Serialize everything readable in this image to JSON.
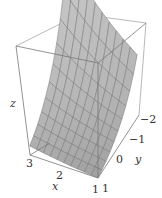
{
  "chart_data": {
    "type": "surface3d",
    "title": "",
    "xlabel": "x",
    "ylabel": "y",
    "zlabel": "z",
    "x_ticks": [
      "1",
      "2",
      "3"
    ],
    "y_ticks": [
      "0",
      "−1",
      "−2"
    ],
    "z_ticks": [],
    "xlim": [
      1,
      3
    ],
    "ylim": [
      -2,
      1
    ],
    "grid_lines": 10,
    "surface_description": "Mesh surface rising steeply toward x=1, y=-2 corner and flattening toward large x / positive y (exponential-like decay)",
    "surface_color": "#b8b8b8",
    "mesh_color": "#6e6e6e",
    "box_color": "#888888",
    "box_visible": true,
    "legend": null
  },
  "labels": {
    "z_axis": "z",
    "x_axis": "x",
    "y_axis": "y",
    "x_tick_3": "3",
    "x_tick_2": "2",
    "x_tick_1": "1",
    "y_tick_1": "1",
    "y_tick_0": "0",
    "y_tick_m1": "−1",
    "y_tick_m2": "−2"
  }
}
